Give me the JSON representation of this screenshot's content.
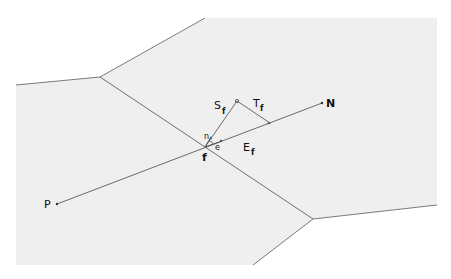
{
  "diagram": {
    "type": "finite-volume-mesh-face",
    "background": "#ffffff",
    "cell_fill": "#efefef",
    "edge_color": "#707070",
    "vector_color": "#6a6a6a",
    "labels": {
      "P": "P",
      "N": "N",
      "f": "f",
      "S": "S",
      "S_sub": "f",
      "T": "T",
      "T_sub": "f",
      "E": "E",
      "E_sub": "f",
      "n": "n",
      "e": "e"
    },
    "points": {
      "P": [
        57,
        204
      ],
      "N": [
        322,
        103
      ],
      "f": [
        205,
        147
      ],
      "S_tip": [
        237,
        101
      ],
      "T_foot": [
        270,
        123
      ]
    }
  }
}
